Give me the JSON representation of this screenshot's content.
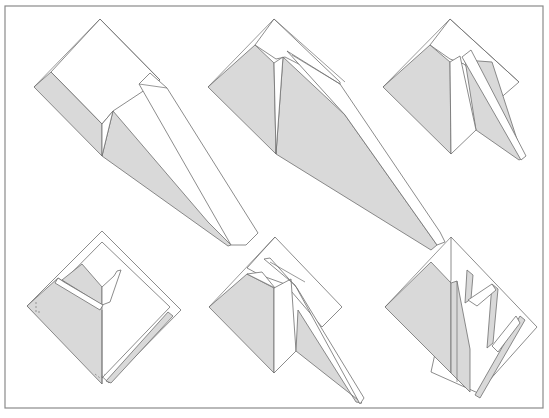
{
  "diagram": {
    "type": "folding-sequence",
    "colors": {
      "background": "#ffffff",
      "frame": "#8a8a8a",
      "shaded_face": "#d9d9d9",
      "outline": "#6e6e6e"
    },
    "frame": {
      "x": 5,
      "y": 6,
      "width": 538,
      "height": 402
    },
    "steps": [
      {
        "id": 1,
        "position": "top-left",
        "shapes": [
          {
            "kind": "paper",
            "points": "100,19 160,80 113,111 102,124 51,72"
          },
          {
            "kind": "shade",
            "points": "34,87 51,72 102,124 102,156"
          },
          {
            "kind": "shade",
            "points": "102,156 113,111 208,222 231,245 228,246"
          },
          {
            "kind": "paper",
            "points": "102,124 113,111 102,156"
          },
          {
            "kind": "paper",
            "points": "139,84 150,73 167,88 258,233 246,245 231,245"
          },
          {
            "kind": "line",
            "points": "139,84 167,88"
          },
          {
            "kind": "line",
            "points": "100,19 34,87"
          },
          {
            "kind": "line",
            "points": "100,19 160,80"
          }
        ]
      },
      {
        "id": 2,
        "position": "top-center",
        "shapes": [
          {
            "kind": "paper",
            "points": "274,19 340,82 340,85 285,57 276,59 255,45"
          },
          {
            "kind": "shade",
            "points": "208,87 255,45 274,63 276,154"
          },
          {
            "kind": "shade",
            "points": "276,154 283,57 345,115 437,245 431,250"
          },
          {
            "kind": "paper",
            "points": "274,63 283,57 276,154"
          },
          {
            "kind": "paper",
            "points": "287,51 340,84 440,232 445,242 437,245 345,115"
          },
          {
            "kind": "line",
            "points": "292,55 340,84"
          },
          {
            "kind": "line",
            "points": "274,19 208,87"
          },
          {
            "kind": "line",
            "points": "274,19 345,82"
          }
        ]
      },
      {
        "id": 3,
        "position": "top-right",
        "shapes": [
          {
            "kind": "paper",
            "points": "450,19 519,82 497,101 464,64 450,59 430,45"
          },
          {
            "kind": "shade",
            "points": "383,87 430,45 450,62 451,154"
          },
          {
            "kind": "shade",
            "points": "465,60 476,130 519,160 523,158 492,62"
          },
          {
            "kind": "paper",
            "points": "450,62 460,56 476,130 451,154"
          },
          {
            "kind": "paper",
            "points": "462,57 471,50 526,156 521,160"
          },
          {
            "kind": "line",
            "points": "450,19 383,87"
          },
          {
            "kind": "line",
            "points": "450,19 519,82"
          }
        ]
      },
      {
        "id": 4,
        "position": "bottom-left",
        "shapes": [
          {
            "kind": "paper",
            "points": "102,231 181,310 109,383 27,306"
          },
          {
            "kind": "paper",
            "points": "102,242 170,307 102,378 38,307"
          },
          {
            "kind": "shade",
            "points": "27,306 58,278 102,306 102,384"
          },
          {
            "kind": "shade",
            "points": "62,280 82,264 102,287 102,305"
          },
          {
            "kind": "paper",
            "points": "102,305 102,287 114,276 117,271 121,270 110,302"
          },
          {
            "kind": "paper",
            "points": "58,278 64,282 103,305 100,310 55,283"
          },
          {
            "kind": "shade",
            "points": "168,312 173,316 111,383 106,381"
          },
          {
            "kind": "line",
            "points": "102,310 102,384"
          },
          {
            "kind": "dash",
            "points": "36,302 36,312 42,312"
          },
          {
            "kind": "dash",
            "points": "95,374 100,378 105,374"
          }
        ]
      },
      {
        "id": 5,
        "position": "bottom-center",
        "shapes": [
          {
            "kind": "paper",
            "points": "275,237 342,307 322,327 285,284 260,275 247,268"
          },
          {
            "kind": "shade",
            "points": "209,307 247,274 274,288 274,373"
          },
          {
            "kind": "paper",
            "points": "247,274 262,272 275,288"
          },
          {
            "kind": "paper",
            "points": "274,288 291,279 296,351 274,373"
          },
          {
            "kind": "shade",
            "points": "296,351 298,310 356,402 362,403"
          },
          {
            "kind": "paper",
            "points": "264,259 270,258 297,288 364,398 360,404 295,285"
          },
          {
            "kind": "line",
            "points": "275,237 209,307"
          },
          {
            "kind": "line",
            "points": "270,262 305,282"
          }
        ]
      },
      {
        "id": 6,
        "position": "bottom-right",
        "shapes": [
          {
            "kind": "paper",
            "points": "451,237 537,327 478,393 431,372 451,280"
          },
          {
            "kind": "shade",
            "points": "385,307 431,262 451,283 451,373"
          },
          {
            "kind": "shade",
            "points": "451,283 457,281 470,349 470,392 451,373"
          },
          {
            "kind": "shade",
            "points": "465,303 471,299 473,275 467,270"
          },
          {
            "kind": "shade",
            "points": "487,348 493,343 498,289 492,284"
          },
          {
            "kind": "shade",
            "points": "475,395 480,398 525,320 520,316"
          },
          {
            "kind": "paper",
            "points": "468,300 477,306 496,290 492,284"
          },
          {
            "kind": "paper",
            "points": "492,346 498,352 520,323 516,316"
          },
          {
            "kind": "line",
            "points": "451,237 385,307"
          },
          {
            "kind": "line",
            "points": "457,281 457,382"
          }
        ]
      }
    ]
  }
}
